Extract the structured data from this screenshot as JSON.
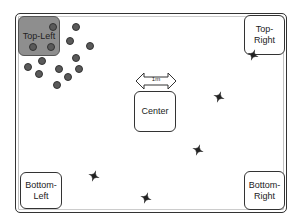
{
  "diagram": {
    "colors": {
      "frame": "#333333",
      "active_zone_fill": "#8e8e8e",
      "dot_fill": "#5a5a5a",
      "drone_fill": "#333333"
    },
    "zones": [
      {
        "id": "top-left",
        "label": "Top-Left",
        "x": 18,
        "y": 16,
        "w": 42,
        "h": 40,
        "active": true
      },
      {
        "id": "top-right",
        "label": "Top-\nRight",
        "x": 244,
        "y": 15,
        "w": 41,
        "h": 40,
        "active": false
      },
      {
        "id": "center",
        "label": "Center",
        "x": 134,
        "y": 91,
        "w": 42,
        "h": 41,
        "active": false
      },
      {
        "id": "bottom-left",
        "label": "Bottom-\nLeft",
        "x": 20,
        "y": 172,
        "w": 42,
        "h": 37,
        "active": false
      },
      {
        "id": "bottom-right",
        "label": "Bottom-\nRight",
        "x": 244,
        "y": 171,
        "w": 41,
        "h": 39,
        "active": false
      }
    ],
    "scale_bar": {
      "label": "1m"
    },
    "dots": [
      [
        53,
        27
      ],
      [
        76,
        27
      ],
      [
        70,
        41
      ],
      [
        90,
        46
      ],
      [
        33,
        47
      ],
      [
        51,
        47
      ],
      [
        76,
        58
      ],
      [
        42,
        61
      ],
      [
        28,
        67
      ],
      [
        59,
        69
      ],
      [
        79,
        69
      ],
      [
        39,
        74
      ],
      [
        68,
        77
      ],
      [
        57,
        85
      ]
    ],
    "drones": [
      [
        253,
        53
      ],
      [
        219,
        95
      ],
      [
        198,
        148
      ],
      [
        94,
        174
      ],
      [
        146,
        196
      ]
    ]
  }
}
